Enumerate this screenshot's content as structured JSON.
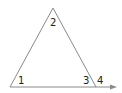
{
  "diagram": {
    "type": "triangle-exterior-angle",
    "line_color": "#8a8a8a",
    "arrow_color": "#8a8a8a",
    "labels": {
      "angle_1": "1",
      "angle_2": "2",
      "angle_3": "3",
      "angle_4": "4"
    }
  }
}
